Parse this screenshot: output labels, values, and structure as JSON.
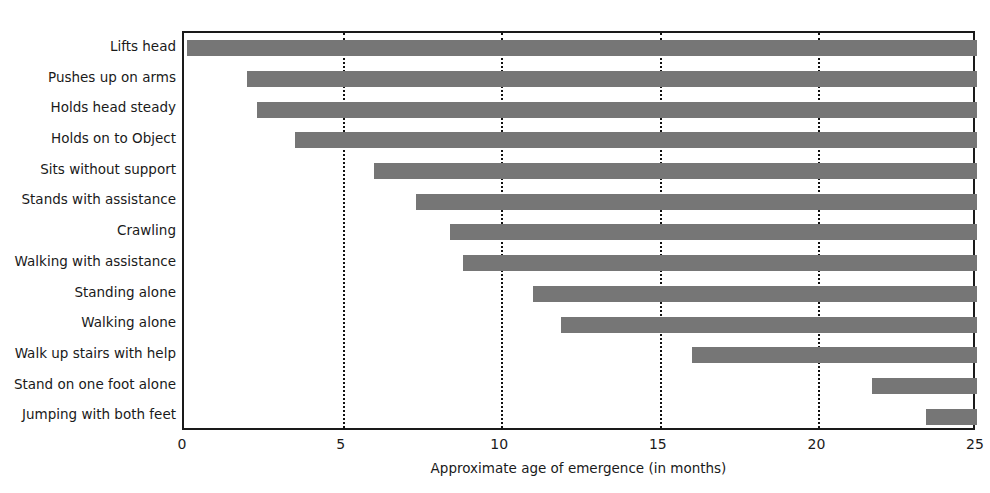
{
  "chart_data": {
    "type": "bar",
    "orientation": "horizontal",
    "title": "",
    "xlabel": "Approximate age of emergence (in months)",
    "ylabel": "",
    "xlim": [
      0,
      25
    ],
    "xticks": [
      0,
      5,
      10,
      15,
      20,
      25
    ],
    "xticklabels": [
      "0",
      "5",
      "10",
      "15",
      "20",
      "25"
    ],
    "gridlines": {
      "vertical_at": [
        5,
        10,
        15,
        20
      ],
      "style": "dotted",
      "horizontal": false
    },
    "legend": null,
    "bar_color": "#767676",
    "note": "Each bar spans from the milestone's approximate age of emergence to the right edge of the axis (25 months).",
    "categories": [
      "Lifts head",
      "Pushes up on arms",
      "Holds head steady",
      "Holds on to Object",
      "Sits without support",
      "Stands with assistance",
      "Crawling",
      "Walking with assistance",
      "Standing alone",
      "Walking alone",
      "Walk up stairs with help",
      "Stand on one foot alone",
      "Jumping with both feet"
    ],
    "values": [
      0.1,
      2.0,
      2.3,
      3.5,
      6.0,
      7.3,
      8.4,
      8.8,
      11.0,
      11.9,
      16.0,
      21.7,
      23.4
    ],
    "bar_end": 25
  }
}
